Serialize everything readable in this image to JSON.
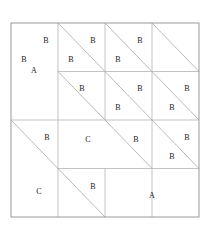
{
  "title": "Block #19",
  "colors": {
    "background": "#ffffff",
    "outline": "#9a9a9a",
    "gridline": "#b4b4b4",
    "diagonal": "#a8a8a8",
    "label_text": "#1a1a1a",
    "title_text": "#111111"
  },
  "block": {
    "name": "Block #19",
    "grid": {
      "columns": 4,
      "rows": 4
    },
    "bounds": {
      "x": 11,
      "y": 23,
      "width": 188,
      "height": 194
    },
    "cell": {
      "width": 47,
      "height": 48.5
    }
  },
  "patches": [
    {
      "id": "patch-a-top-left",
      "label": "A",
      "shape": "rectangle",
      "label_x": 34,
      "label_y": 71,
      "x": 11,
      "y": 23,
      "width": 47,
      "height": 97
    },
    {
      "id": "patch-hst-r0c1",
      "label_upper": "B",
      "label_lower": "B",
      "shape": "half-square-triangle",
      "diagonal": "tl-br",
      "label_upper_x": 46,
      "label_upper_y": 41,
      "label_lower_x": 24,
      "label_lower_y": 60,
      "x": 58,
      "y": 23,
      "width": 47,
      "height": 48.5
    },
    {
      "id": "patch-hst-r0c2",
      "label_upper": "B",
      "label_lower": "B",
      "shape": "half-square-triangle",
      "diagonal": "tl-br",
      "label_upper_x": 93,
      "label_upper_y": 41,
      "label_lower_x": 71,
      "label_lower_y": 60,
      "x": 105,
      "y": 23,
      "width": 47,
      "height": 48.5
    },
    {
      "id": "patch-hst-r0c3",
      "label_upper": "B",
      "label_lower": "B",
      "shape": "half-square-triangle",
      "diagonal": "tl-br",
      "label_upper_x": 140,
      "label_upper_y": 41,
      "label_lower_x": 118,
      "label_lower_y": 60,
      "x": 152,
      "y": 23,
      "width": 47,
      "height": 48.5
    },
    {
      "id": "patch-hst-r1c2",
      "label_upper": "B",
      "label_lower": "B",
      "shape": "half-square-triangle",
      "diagonal": "tl-br",
      "label_upper_x": 93,
      "label_upper_y": 89,
      "label_lower_x": 71,
      "label_lower_y": 108,
      "x": 105,
      "y": 71.5,
      "width": 47,
      "height": 48.5
    },
    {
      "id": "patch-hst-r1c3",
      "label_upper": "B",
      "label_lower": "B",
      "shape": "half-square-triangle",
      "diagonal": "tl-br",
      "label_upper_x": 140,
      "label_upper_y": 89,
      "label_lower_x": 118,
      "label_lower_y": 108,
      "x": 152,
      "y": 71.5,
      "width": 47,
      "height": 48.5
    },
    {
      "id": "patch-hst-r2c3",
      "label_upper": "B",
      "label_lower": "B",
      "shape": "half-square-triangle",
      "diagonal": "tl-br",
      "label_upper_x": 140,
      "label_upper_y": 138,
      "label_lower_x": 118,
      "label_lower_y": 157,
      "x": 152,
      "y": 120,
      "width": 47,
      "height": 48.5
    },
    {
      "id": "patch-hst-center",
      "label_upper": "B",
      "label_lower": "C",
      "shape": "half-square-triangle",
      "diagonal": "tl-br",
      "label_upper_x": 88,
      "label_upper_y": 143,
      "label_lower_x": 40,
      "label_lower_y": 93,
      "x": 58,
      "y": 71.5,
      "width": 94,
      "height": 97
    },
    {
      "id": "patch-hst-bottom-left",
      "label_upper": "B",
      "label_lower": "C",
      "shape": "half-square-triangle",
      "diagonal": "tl-br",
      "label_upper_x": 58,
      "label_upper_y": 144,
      "label_lower_x": 34,
      "label_lower_y": 193,
      "x": 11,
      "y": 120,
      "width": 94,
      "height": 97
    },
    {
      "id": "patch-a-bottom-right",
      "label": "A",
      "shape": "rectangle",
      "label_x": 152,
      "label_y": 193,
      "x": 105,
      "y": 168.5,
      "width": 94,
      "height": 48.5
    }
  ],
  "labels": {
    "a_top_left": "A",
    "a_bottom_right": "A",
    "c_center": "C",
    "c_bottom_left": "C",
    "b_r0c1_upper": "B",
    "b_r0c1_lower": "B",
    "b_r0c2_upper": "B",
    "b_r0c2_lower": "B",
    "b_r0c3_upper": "B",
    "b_r0c3_lower": "B",
    "b_r1c1": "B",
    "b_r1c2_upper": "B",
    "b_r1c2_lower": "B",
    "b_r1c3_upper": "B",
    "b_r1c3_lower": "B",
    "b_r2c2": "B",
    "b_r2c3_upper": "B",
    "b_r2c3_lower": "B",
    "b_bottom_left": "B"
  }
}
